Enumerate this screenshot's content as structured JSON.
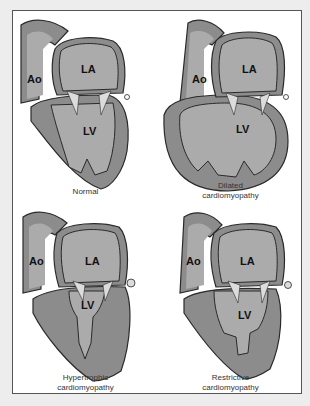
{
  "figure": {
    "colors": {
      "background": "#ededed",
      "frame": "#ffffff",
      "wall": "#8c8c8c",
      "chamber": "#ababab",
      "valve": "#dcdcdc",
      "outline": "#2a2a2a"
    },
    "panels": [
      {
        "id": "normal",
        "labels": {
          "aorta": "Ao",
          "atrium": "LA",
          "ventricle": "LV"
        },
        "caption_lines": [
          "Normal"
        ]
      },
      {
        "id": "dilated",
        "labels": {
          "aorta": "Ao",
          "atrium": "LA",
          "ventricle": "LV"
        },
        "caption_lines": [
          "Dilated",
          "cardiomyopathy"
        ]
      },
      {
        "id": "hypertrophic",
        "labels": {
          "aorta": "Ao",
          "atrium": "LA",
          "ventricle": "LV"
        },
        "caption_lines": [
          "Hypertrophic",
          "cardiomyopathy"
        ]
      },
      {
        "id": "restrictive",
        "labels": {
          "aorta": "Ao",
          "atrium": "LA",
          "ventricle": "LV"
        },
        "caption_lines": [
          "Restrictive",
          "cardiomyopathy"
        ]
      }
    ]
  }
}
